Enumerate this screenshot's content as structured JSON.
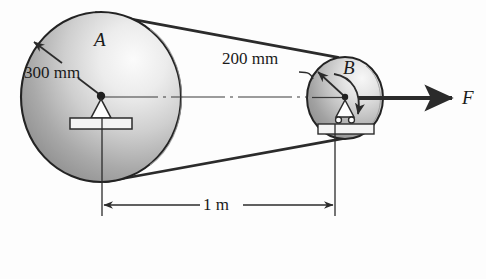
{
  "figure": {
    "type": "engineering-diagram",
    "background_color": "#fdfdfd",
    "line_color": "#2b2b2b",
    "text_color": "#1a1a1a"
  },
  "labels": {
    "pulley_a": "A",
    "pulley_b": "B",
    "radius_a": "300 mm",
    "radius_b": "200 mm",
    "center_distance": "1 m",
    "force": "F"
  },
  "geometry": {
    "pulley_a": {
      "cx": 101,
      "cy": 97,
      "rx": 80,
      "ry": 85
    },
    "pulley_b": {
      "cx": 345,
      "cy": 98,
      "rx": 38,
      "ry": 41
    },
    "centerline_y": 97,
    "dimension_line": {
      "y": 205,
      "x1": 102,
      "x2": 335
    },
    "force_arrow": {
      "y": 98,
      "x1": 381,
      "x2": 455
    }
  },
  "annotations": {
    "radius_a_leader": "arrow from 300 mm text up-left to rim of pulley A",
    "radius_b_leader": "curved leader from 200 mm text right to rim of pulley B",
    "rotation_arrow_b": "curved arrow clockwise at pulley B",
    "support_a": "pin support triangle with base plate",
    "support_b": "roller support triangle with two rollers and base plate"
  },
  "icon_names": {
    "pin_support": "pin-support-icon",
    "roller_support": "roller-support-icon",
    "rotation": "rotation-arrow-icon",
    "force": "force-arrow-icon"
  }
}
